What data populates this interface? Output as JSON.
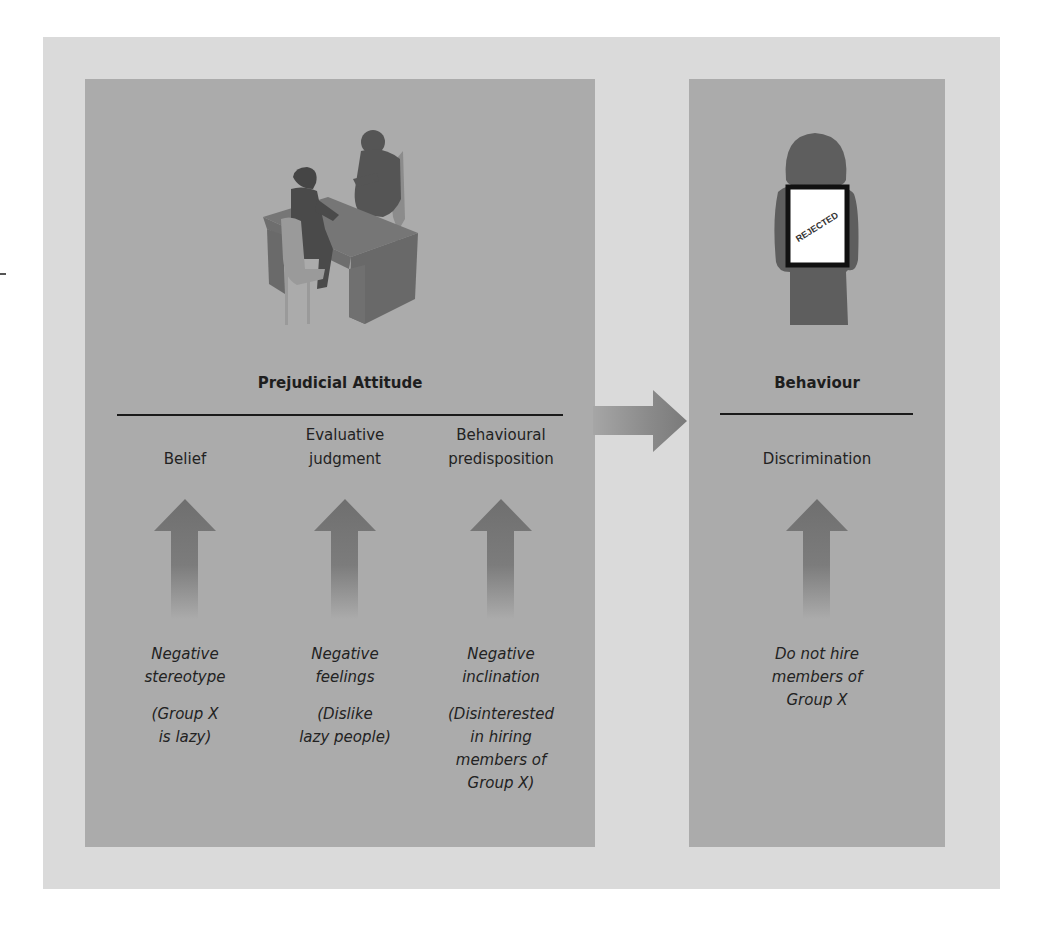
{
  "diagram": {
    "left_panel": {
      "heading": "Prejudicial Attitude",
      "illustration": "meeting-interview-icon",
      "columns": [
        {
          "label_lines": [
            "Belief"
          ],
          "main_lines": [
            "Negative",
            "stereotype"
          ],
          "example_lines": [
            "(Group X",
            "is lazy)"
          ]
        },
        {
          "label_lines": [
            "Evaluative",
            "judgment"
          ],
          "main_lines": [
            "Negative",
            "feelings"
          ],
          "example_lines": [
            "(Dislike",
            "lazy people)"
          ]
        },
        {
          "label_lines": [
            "Behavioural",
            "predisposition"
          ],
          "main_lines": [
            "Negative",
            "inclination"
          ],
          "example_lines": [
            "(Disinterested",
            "in hiring",
            "members of",
            "Group X)"
          ]
        }
      ]
    },
    "right_panel": {
      "heading": "Behaviour",
      "illustration": "rejected-person-icon",
      "sign_text": "REJECTED",
      "column": {
        "label_lines": [
          "Discrimination"
        ],
        "main_lines": [
          "Do not hire",
          "members of",
          "Group X"
        ]
      }
    },
    "connector": "right-arrow-icon",
    "colors": {
      "outer_frame": "#dadada",
      "panel": "#ababab",
      "arrow": "#7a7a7a",
      "figure": "#5a5a5a",
      "text": "#1e1e1e"
    }
  }
}
